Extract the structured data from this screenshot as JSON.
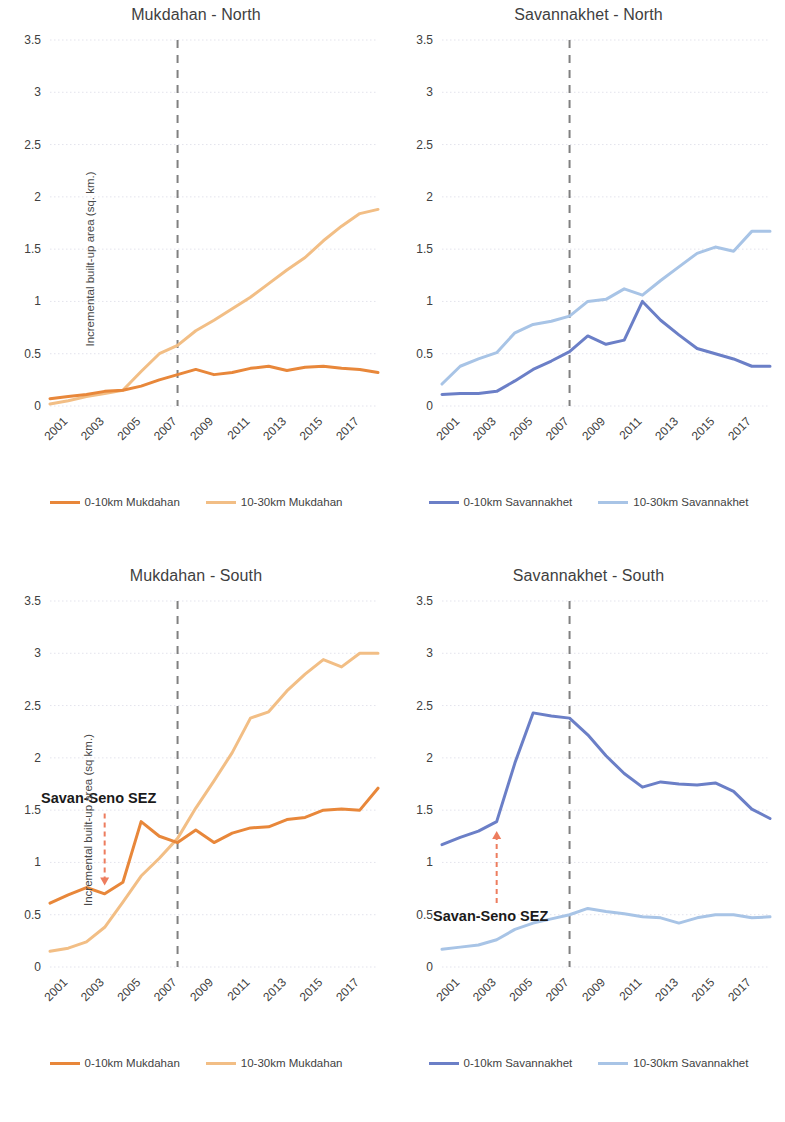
{
  "figure": {
    "panel_count": 4,
    "xlabel": "",
    "x_categories": [
      2000,
      2001,
      2002,
      2003,
      2004,
      2005,
      2006,
      2007,
      2008,
      2009,
      2010,
      2011,
      2012,
      2013,
      2014,
      2015,
      2016,
      2017,
      2018
    ],
    "x_tick_labels": [
      "2001",
      "2003",
      "2005",
      "2007",
      "2009",
      "2011",
      "2013",
      "2015",
      "2017"
    ],
    "y_tick_labels": [
      "0",
      "0.5",
      "1",
      "1.5",
      "2",
      "2.5",
      "3",
      "3.5"
    ],
    "ylim": [
      0,
      3.5
    ],
    "colors": {
      "orange_dark": "#E8873A",
      "orange_light": "#F2BE85",
      "blue_dark": "#6B7FC7",
      "blue_light": "#A8C4E6",
      "sez_arrow": "#ED7D5E",
      "event_line": "#808080",
      "grid": "#E3E3EC",
      "text": "#404040"
    },
    "event_marker_year": 2007,
    "sez_annotation_label": "Savan-Seno SEZ",
    "sez_annotation_year": 2003
  },
  "chart_data": [
    {
      "type": "line",
      "panel": "top-left",
      "title": "Mukdahan - North",
      "xlabel": "",
      "ylabel": "Incremental built-up area (sq. km.)",
      "ylim": [
        0,
        3.5
      ],
      "grid": true,
      "legend_position": "bottom",
      "x": [
        2000,
        2001,
        2002,
        2003,
        2004,
        2005,
        2006,
        2007,
        2008,
        2009,
        2010,
        2011,
        2012,
        2013,
        2014,
        2015,
        2016,
        2017,
        2018
      ],
      "event_line": {
        "year": 2007,
        "style": "dashed",
        "color": "#808080"
      },
      "series": [
        {
          "name": "0-10km Mukdahan",
          "color": "#E8873A",
          "values": [
            0.07,
            0.09,
            0.11,
            0.14,
            0.15,
            0.19,
            0.25,
            0.3,
            0.35,
            0.3,
            0.32,
            0.36,
            0.38,
            0.34,
            0.37,
            0.38,
            0.36,
            0.35,
            0.32
          ]
        },
        {
          "name": "10-30km Mukdahan",
          "color": "#F2BE85",
          "values": [
            0.02,
            0.05,
            0.09,
            0.12,
            0.15,
            0.33,
            0.5,
            0.58,
            0.72,
            0.82,
            0.93,
            1.04,
            1.17,
            1.3,
            1.42,
            1.58,
            1.72,
            1.84,
            1.88
          ]
        }
      ]
    },
    {
      "type": "line",
      "panel": "top-right",
      "title": "Savannakhet - North",
      "xlabel": "",
      "ylabel": "",
      "ylim": [
        0,
        3.5
      ],
      "grid": true,
      "legend_position": "bottom",
      "x": [
        2000,
        2001,
        2002,
        2003,
        2004,
        2005,
        2006,
        2007,
        2008,
        2009,
        2010,
        2011,
        2012,
        2013,
        2014,
        2015,
        2016,
        2017,
        2018
      ],
      "event_line": {
        "year": 2007,
        "style": "dashed",
        "color": "#808080"
      },
      "series": [
        {
          "name": "0-10km Savannakhet",
          "color": "#6B7FC7",
          "values": [
            0.11,
            0.12,
            0.12,
            0.14,
            0.24,
            0.35,
            0.43,
            0.52,
            0.67,
            0.59,
            0.63,
            1.0,
            0.82,
            0.68,
            0.55,
            0.5,
            0.45,
            0.38,
            0.38
          ]
        },
        {
          "name": "10-30km Savannakhet",
          "color": "#A8C4E6",
          "values": [
            0.21,
            0.38,
            0.45,
            0.51,
            0.7,
            0.78,
            0.81,
            0.86,
            1.0,
            1.02,
            1.12,
            1.06,
            1.2,
            1.33,
            1.46,
            1.52,
            1.48,
            1.67,
            1.67
          ]
        }
      ]
    },
    {
      "type": "line",
      "panel": "bottom-left",
      "title": "Mukdahan - South",
      "xlabel": "",
      "ylabel": "Incremental built-up area (sq km.)",
      "ylim": [
        0,
        3.5
      ],
      "grid": true,
      "legend_position": "bottom",
      "x": [
        2000,
        2001,
        2002,
        2003,
        2004,
        2005,
        2006,
        2007,
        2008,
        2009,
        2010,
        2011,
        2012,
        2013,
        2014,
        2015,
        2016,
        2017,
        2018
      ],
      "event_line": {
        "year": 2007,
        "style": "dashed",
        "color": "#808080"
      },
      "annotation": {
        "label": "Savan-Seno SEZ",
        "year": 2003,
        "arrow_to": 0.78
      },
      "series": [
        {
          "name": "0-10km Mukdahan",
          "color": "#E8873A",
          "values": [
            0.61,
            0.69,
            0.76,
            0.7,
            0.81,
            1.39,
            1.25,
            1.19,
            1.31,
            1.19,
            1.28,
            1.33,
            1.34,
            1.41,
            1.43,
            1.5,
            1.51,
            1.5,
            1.71
          ]
        },
        {
          "name": "10-30km Mukdahan",
          "color": "#F2BE85",
          "values": [
            0.15,
            0.18,
            0.24,
            0.38,
            0.62,
            0.87,
            1.04,
            1.23,
            1.52,
            1.78,
            2.05,
            2.38,
            2.44,
            2.64,
            2.8,
            2.94,
            2.87,
            3.0,
            3.0
          ]
        }
      ]
    },
    {
      "type": "line",
      "panel": "bottom-right",
      "title": "Savannakhet - South",
      "xlabel": "",
      "ylabel": "",
      "ylim": [
        0,
        3.5
      ],
      "grid": true,
      "legend_position": "bottom",
      "x": [
        2000,
        2001,
        2002,
        2003,
        2004,
        2005,
        2006,
        2007,
        2008,
        2009,
        2010,
        2011,
        2012,
        2013,
        2014,
        2015,
        2016,
        2017,
        2018
      ],
      "event_line": {
        "year": 2007,
        "style": "dashed",
        "color": "#808080"
      },
      "annotation": {
        "label": "Savan-Seno SEZ",
        "year": 2003,
        "arrow_to": 1.3
      },
      "series": [
        {
          "name": "0-10km Savannakhet",
          "color": "#6B7FC7",
          "values": [
            1.17,
            1.24,
            1.3,
            1.39,
            1.95,
            2.43,
            2.4,
            2.38,
            2.22,
            2.02,
            1.85,
            1.72,
            1.77,
            1.75,
            1.74,
            1.76,
            1.68,
            1.51,
            1.42
          ]
        },
        {
          "name": "10-30km Savannakhet",
          "color": "#A8C4E6",
          "values": [
            0.17,
            0.19,
            0.21,
            0.26,
            0.36,
            0.42,
            0.46,
            0.5,
            0.56,
            0.53,
            0.51,
            0.48,
            0.47,
            0.42,
            0.47,
            0.5,
            0.5,
            0.47,
            0.48
          ]
        }
      ]
    }
  ]
}
